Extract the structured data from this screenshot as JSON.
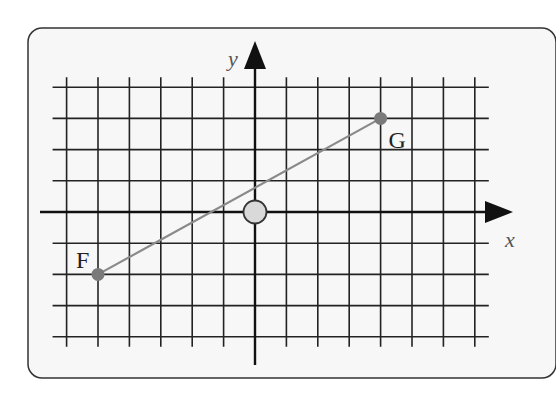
{
  "diagram": {
    "axes": {
      "x_label": "x",
      "y_label": "y"
    },
    "grid": {
      "x_range": [
        -6,
        7
      ],
      "y_range": [
        -4,
        4
      ],
      "step": 1
    },
    "points": [
      {
        "name": "F",
        "label": "F",
        "x": -5,
        "y": -2,
        "color": "#7a7a7a"
      },
      {
        "name": "G",
        "label": "G",
        "x": 4,
        "y": 3,
        "color": "#7a7a7a"
      }
    ],
    "segment": {
      "from": "F",
      "to": "G",
      "color": "#8a8a8a"
    },
    "origin_marker": {
      "fill": "#d9d9d9",
      "stroke": "#333333"
    },
    "colors": {
      "panel_background": "#f7f7f7",
      "panel_border": "#333333",
      "grid_line": "#222222",
      "axis": "#111111"
    }
  }
}
